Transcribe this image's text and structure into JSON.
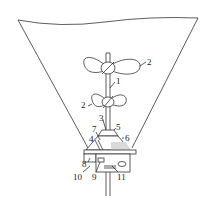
{
  "diagram": {
    "labels": [
      {
        "id": "1",
        "text": "1"
      },
      {
        "id": "2a",
        "text": "2"
      },
      {
        "id": "2b",
        "text": "2"
      },
      {
        "id": "3",
        "text": "3"
      },
      {
        "id": "4",
        "text": "4"
      },
      {
        "id": "5",
        "text": "5"
      },
      {
        "id": "6",
        "text": "6"
      },
      {
        "id": "7",
        "text": "7"
      },
      {
        "id": "8",
        "text": "8"
      },
      {
        "id": "9",
        "text": "9"
      },
      {
        "id": "10",
        "text": "10"
      },
      {
        "id": "11",
        "text": "11"
      }
    ]
  }
}
